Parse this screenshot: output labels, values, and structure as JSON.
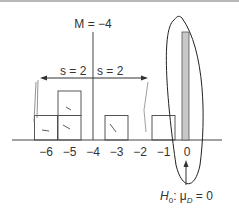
{
  "diagram": {
    "mean_label": "M = −4",
    "sd_left_label": "s = 2",
    "sd_right_label": "s = 2",
    "null_hypothesis_label": "H₀: μ_D = 0",
    "null_h": "H",
    "null_sub0": "0",
    "null_mu": ": μ",
    "null_subD": "D",
    "null_eq": " = 0",
    "axis_ticks": [
      "−6",
      "−5",
      "−4",
      "−3",
      "−2",
      "−1",
      "0"
    ],
    "tick_values": [
      -6,
      -5,
      -4,
      -3,
      -2,
      -1,
      0
    ],
    "sample_counts": [
      {
        "value": -6,
        "count": 1
      },
      {
        "value": -5,
        "count": 2
      },
      {
        "value": -4,
        "count": 0
      },
      {
        "value": -3,
        "count": 1
      },
      {
        "value": -2,
        "count": 0
      },
      {
        "value": -1,
        "count": 1
      }
    ],
    "mean": -4,
    "sd": 2,
    "null_mean": 0,
    "colors": {
      "line": "#333333",
      "null_bar_fill": "#c8c8c8",
      "annotation": "#222222"
    }
  }
}
